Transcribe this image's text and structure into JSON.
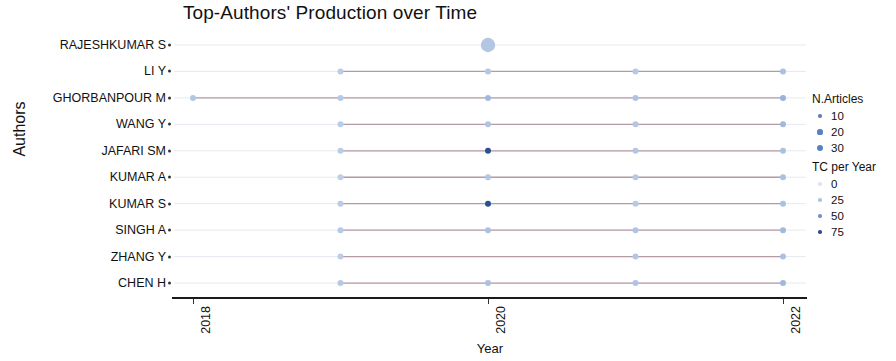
{
  "chart_data": {
    "type": "scatter",
    "title": "Top-Authors' Production over Time",
    "xlabel": "Year",
    "ylabel": "Authors",
    "xlim": [
      2017.6,
      2022.4
    ],
    "xticks": [
      2018,
      2020,
      2022
    ],
    "xtick_labels": [
      "2018",
      "2020",
      "2022"
    ],
    "grid": false,
    "categories": [
      "RAJESHKUMAR S",
      "LI Y",
      "GHORBANPOUR M",
      "WANG Y",
      "JAFARI SM",
      "KUMAR A",
      "KUMAR S",
      "SINGH A",
      "ZHANG Y",
      "CHEN H"
    ],
    "size_legend": {
      "title": "N.Articles",
      "values": [
        10,
        20,
        30
      ],
      "labels": [
        "10",
        "20",
        "30"
      ]
    },
    "color_legend": {
      "title": "TC per Year",
      "values": [
        0,
        25,
        50,
        75
      ],
      "labels": [
        "0",
        "25",
        "50",
        "75"
      ],
      "colors": [
        "#dbe5f3",
        "#adc3e3",
        "#6f93cc",
        "#2b4f96"
      ]
    },
    "line_color": "#b89aa6",
    "series": [
      {
        "name": "RAJESHKUMAR S",
        "points": [
          {
            "year": 2020,
            "n_articles": 30,
            "tc_per_year": 22
          }
        ]
      },
      {
        "name": "LI Y",
        "points": [
          {
            "year": 2019,
            "n_articles": 10,
            "tc_per_year": 18
          },
          {
            "year": 2020,
            "n_articles": 10,
            "tc_per_year": 22
          },
          {
            "year": 2021,
            "n_articles": 10,
            "tc_per_year": 20
          },
          {
            "year": 2022,
            "n_articles": 10,
            "tc_per_year": 26
          }
        ]
      },
      {
        "name": "GHORBANPOUR M",
        "points": [
          {
            "year": 2018,
            "n_articles": 10,
            "tc_per_year": 22
          },
          {
            "year": 2019,
            "n_articles": 10,
            "tc_per_year": 20
          },
          {
            "year": 2020,
            "n_articles": 10,
            "tc_per_year": 30
          },
          {
            "year": 2021,
            "n_articles": 10,
            "tc_per_year": 24
          },
          {
            "year": 2022,
            "n_articles": 10,
            "tc_per_year": 34
          }
        ]
      },
      {
        "name": "WANG Y",
        "points": [
          {
            "year": 2019,
            "n_articles": 10,
            "tc_per_year": 18
          },
          {
            "year": 2020,
            "n_articles": 10,
            "tc_per_year": 24
          },
          {
            "year": 2021,
            "n_articles": 10,
            "tc_per_year": 22
          },
          {
            "year": 2022,
            "n_articles": 10,
            "tc_per_year": 30
          }
        ]
      },
      {
        "name": "JAFARI SM",
        "points": [
          {
            "year": 2019,
            "n_articles": 10,
            "tc_per_year": 18
          },
          {
            "year": 2020,
            "n_articles": 10,
            "tc_per_year": 75
          },
          {
            "year": 2021,
            "n_articles": 10,
            "tc_per_year": 22
          },
          {
            "year": 2022,
            "n_articles": 10,
            "tc_per_year": 26
          }
        ]
      },
      {
        "name": "KUMAR A",
        "points": [
          {
            "year": 2019,
            "n_articles": 10,
            "tc_per_year": 16
          },
          {
            "year": 2020,
            "n_articles": 10,
            "tc_per_year": 22
          },
          {
            "year": 2021,
            "n_articles": 10,
            "tc_per_year": 20
          },
          {
            "year": 2022,
            "n_articles": 10,
            "tc_per_year": 26
          }
        ]
      },
      {
        "name": "KUMAR S",
        "points": [
          {
            "year": 2019,
            "n_articles": 10,
            "tc_per_year": 18
          },
          {
            "year": 2020,
            "n_articles": 10,
            "tc_per_year": 75
          },
          {
            "year": 2021,
            "n_articles": 10,
            "tc_per_year": 20
          },
          {
            "year": 2022,
            "n_articles": 10,
            "tc_per_year": 26
          }
        ]
      },
      {
        "name": "SINGH A",
        "points": [
          {
            "year": 2019,
            "n_articles": 10,
            "tc_per_year": 20
          },
          {
            "year": 2020,
            "n_articles": 10,
            "tc_per_year": 26
          },
          {
            "year": 2021,
            "n_articles": 10,
            "tc_per_year": 24
          },
          {
            "year": 2022,
            "n_articles": 10,
            "tc_per_year": 30
          }
        ]
      },
      {
        "name": "ZHANG Y",
        "points": [
          {
            "year": 2019,
            "n_articles": 10,
            "tc_per_year": 18
          },
          {
            "year": 2021,
            "n_articles": 10,
            "tc_per_year": 22
          },
          {
            "year": 2022,
            "n_articles": 10,
            "tc_per_year": 26
          }
        ]
      },
      {
        "name": "CHEN H",
        "points": [
          {
            "year": 2019,
            "n_articles": 10,
            "tc_per_year": 20
          },
          {
            "year": 2020,
            "n_articles": 10,
            "tc_per_year": 26
          },
          {
            "year": 2021,
            "n_articles": 10,
            "tc_per_year": 24
          },
          {
            "year": 2022,
            "n_articles": 10,
            "tc_per_year": 30
          }
        ]
      }
    ]
  }
}
